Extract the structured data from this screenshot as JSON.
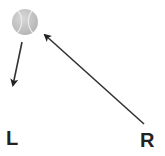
{
  "diagram": {
    "ball": {
      "icon": "tennis-ball-icon",
      "cx": 25,
      "cy": 22,
      "r": 13,
      "fill": "#c8c8c8",
      "seam": "#e8e8e8"
    },
    "arrows": [
      {
        "name": "left-arrow",
        "x1": 22,
        "y1": 42,
        "x2": 13,
        "y2": 85,
        "color": "#333333"
      },
      {
        "name": "right-arrow",
        "x1": 144,
        "y1": 124,
        "x2": 45,
        "y2": 35,
        "color": "#333333"
      }
    ],
    "labels": {
      "left": "L",
      "right": "R"
    }
  }
}
